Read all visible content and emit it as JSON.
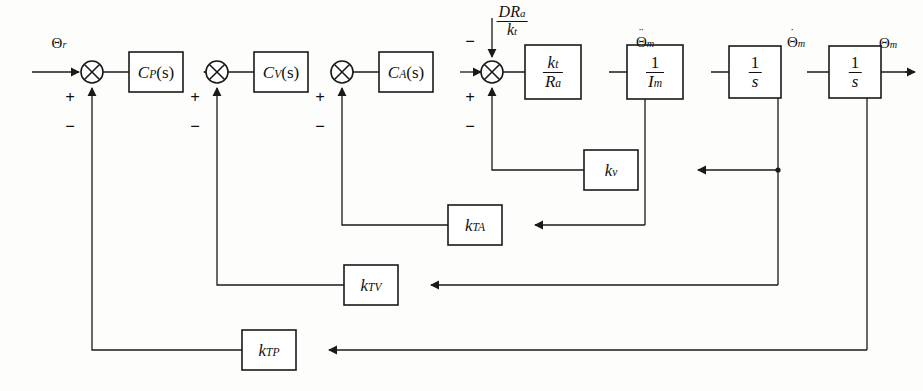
{
  "figure": {
    "type": "control-system-block-diagram",
    "background_color": "#fdfdfc",
    "line_color": "#1a1a1a"
  },
  "signals": {
    "reference_input": "Θ",
    "reference_input_sub": "r",
    "accel_label": "Θ",
    "accel_sub": "m",
    "accel_dots": "¨",
    "vel_label": "Θ",
    "vel_sub": "m",
    "vel_dots": "˙",
    "pos_label": "Θ",
    "pos_sub": "m",
    "disturbance_num_1": "D",
    "disturbance_num_2": "R",
    "disturbance_num_2_sub": "a",
    "disturbance_den": "k",
    "disturbance_den_sub": "t"
  },
  "blocks": [
    {
      "name": "position-controller",
      "label_main": "C",
      "label_sub": "P",
      "label_tail": "(s)",
      "x": 156,
      "y": 72,
      "w": 54,
      "h": 40
    },
    {
      "name": "velocity-controller",
      "label_main": "C",
      "label_sub": "V",
      "label_tail": "(s)",
      "x": 281,
      "y": 72,
      "w": 54,
      "h": 40
    },
    {
      "name": "acceleration-controller",
      "label_main": "C",
      "label_sub": "A",
      "label_tail": "(s)",
      "x": 406,
      "y": 72,
      "w": 54,
      "h": 40
    },
    {
      "name": "motor-torque-constant",
      "num_main": "k",
      "num_sub": "t",
      "den_main": "R",
      "den_sub": "a",
      "x": 553,
      "y": 78,
      "w": 56,
      "h": 54
    },
    {
      "name": "motor-inertia",
      "num_main": "1",
      "den_main": "I",
      "den_sub": "m",
      "x": 655,
      "y": 78,
      "w": 56,
      "h": 54
    },
    {
      "name": "first-integrator",
      "num_main": "1",
      "den_main": "s",
      "x": 755,
      "y": 78,
      "w": 52,
      "h": 52
    },
    {
      "name": "second-integrator",
      "num_main": "1",
      "den_main": "s",
      "x": 855,
      "y": 78,
      "w": 52,
      "h": 52
    },
    {
      "name": "velocity-feedback-gain",
      "label_main": "k",
      "label_sub": "v",
      "x": 638,
      "y": 170,
      "w": 54,
      "h": 40
    },
    {
      "name": "acceleration-tach-gain",
      "label_main": "k",
      "label_sub": "TA",
      "x": 475,
      "y": 225,
      "w": 54,
      "h": 40
    },
    {
      "name": "velocity-tach-gain",
      "label_main": "k",
      "label_sub": "TV",
      "x": 371,
      "y": 285,
      "w": 54,
      "h": 40
    },
    {
      "name": "position-tach-gain",
      "label_main": "k",
      "label_sub": "TP",
      "x": 269,
      "y": 350,
      "w": 54,
      "h": 40
    }
  ],
  "summing_junctions": [
    {
      "name": "position-error-junction",
      "x": 92,
      "y": 72,
      "r": 11,
      "plus": "+",
      "minus": "−"
    },
    {
      "name": "velocity-error-junction",
      "x": 217,
      "y": 72,
      "r": 11,
      "plus": "+",
      "minus": "−"
    },
    {
      "name": "acceleration-error-junction",
      "x": 342,
      "y": 72,
      "r": 11,
      "plus": "+",
      "minus": "−"
    },
    {
      "name": "torque-disturbance-junction",
      "x": 492,
      "y": 72,
      "r": 11,
      "plus": "+",
      "minus_top": "−",
      "minus_bottom": "−"
    }
  ],
  "labels": {
    "plus": "+",
    "minus": "−"
  }
}
